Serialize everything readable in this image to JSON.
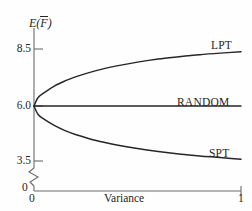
{
  "chart_data": {
    "type": "line",
    "title": "",
    "xlabel": "Variance",
    "ylabel": "E(F̄)",
    "ylabel_parts": {
      "func": "E",
      "open": "(",
      "var": "F",
      "close": ")"
    },
    "xlim": [
      0,
      1
    ],
    "ylim": [
      3.2,
      8.9
    ],
    "xticks": [
      0,
      1
    ],
    "xtick_labels": [
      "0",
      "1"
    ],
    "yticks": [
      3.5,
      6.0,
      8.5
    ],
    "ytick_labels": [
      "3.5",
      "6.0",
      "8.5"
    ],
    "y_axis_break": true,
    "y_zero_label": "0",
    "grid": false,
    "legend": "inline-right",
    "series": [
      {
        "name": "LPT",
        "label": "LPT",
        "color": "#262626",
        "x": [
          0,
          0.02,
          0.05,
          0.1,
          0.15,
          0.2,
          0.3,
          0.4,
          0.5,
          0.6,
          0.7,
          0.8,
          0.9,
          1.0
        ],
        "values": [
          6.0,
          6.38,
          6.6,
          6.9,
          7.12,
          7.3,
          7.58,
          7.79,
          7.96,
          8.1,
          8.2,
          8.29,
          8.36,
          8.42
        ]
      },
      {
        "name": "RANDOM",
        "label": "RANDOM",
        "color": "#262626",
        "x": [
          0,
          1.0
        ],
        "values": [
          6.0,
          6.0
        ]
      },
      {
        "name": "SPT",
        "label": "SPT",
        "color": "#262626",
        "x": [
          0,
          0.02,
          0.05,
          0.1,
          0.15,
          0.2,
          0.3,
          0.4,
          0.5,
          0.6,
          0.7,
          0.8,
          0.9,
          1.0
        ],
        "values": [
          6.0,
          5.62,
          5.4,
          5.12,
          4.9,
          4.73,
          4.46,
          4.26,
          4.1,
          3.97,
          3.86,
          3.77,
          3.7,
          3.62
        ]
      }
    ],
    "annotations": [
      {
        "text": "LPT",
        "x": 0.88,
        "y": 8.72
      },
      {
        "text": "RANDOM",
        "x": 0.76,
        "y": 6.24
      },
      {
        "text": "SPT",
        "x": 0.87,
        "y": 3.92
      }
    ]
  },
  "axes": {
    "y_label_markup": "E(F)",
    "x_label": "Variance",
    "x_origin_label": "0",
    "x_max_label": "1",
    "y_tick_8_5": "8.5",
    "y_tick_6_0": "6.0",
    "y_tick_3_5": "3.5",
    "y_zero": "0"
  },
  "colors": {
    "ink": "#262626",
    "axis": "#5a5a5a",
    "background": "#fefefe"
  }
}
